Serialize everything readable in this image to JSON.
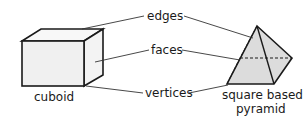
{
  "labels": {
    "edges": "edges",
    "faces": "faces",
    "vertices": "vertices",
    "cuboid": "cuboid",
    "pyramid_line1": "square based",
    "pyramid_line2": "pyramid"
  },
  "colors": {
    "stroke": "#1a1a1a",
    "face_fill": "#e4e4e4",
    "cuboid_front": "#f2f2f2",
    "cuboid_side": "#f6f6f6"
  }
}
